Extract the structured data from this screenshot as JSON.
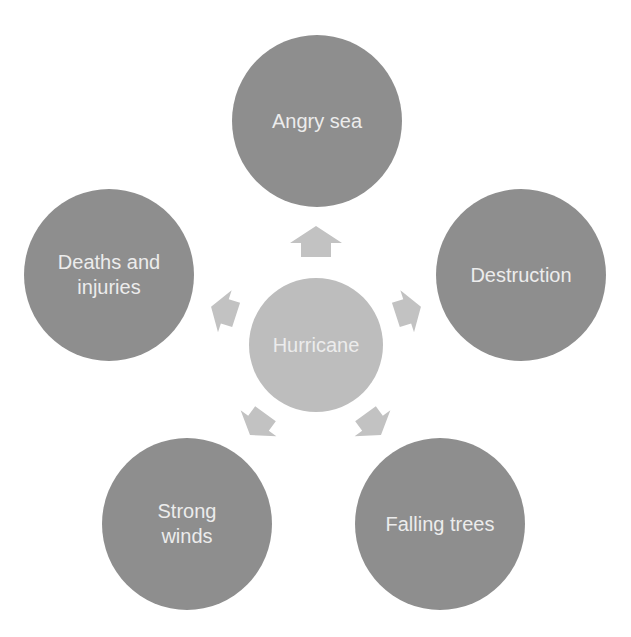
{
  "diagram": {
    "type": "radial-cycle",
    "colors": {
      "background": "#ffffff",
      "outer_node": "#8e8e8e",
      "center_node": "#bdbdbd",
      "arrow": "#c2c2c2",
      "label_text": "#ececec"
    },
    "center": {
      "label": "Hurricane"
    },
    "nodes": [
      {
        "id": "top",
        "label": "Angry sea"
      },
      {
        "id": "right",
        "label": "Destruction"
      },
      {
        "id": "bottom-right",
        "label": "Falling trees"
      },
      {
        "id": "bottom-left",
        "label": "Strong\nwinds",
        "lines": [
          "Strong",
          "winds"
        ]
      },
      {
        "id": "left",
        "label": "Deaths and\ninjuries",
        "lines": [
          "Deaths and",
          "injuries"
        ]
      }
    ],
    "arrows": [
      {
        "from": "Hurricane",
        "to": "Angry sea",
        "icon": "arrow-up-icon"
      },
      {
        "from": "Hurricane",
        "to": "Destruction",
        "icon": "arrow-right-icon"
      },
      {
        "from": "Hurricane",
        "to": "Falling trees",
        "icon": "arrow-down-right-icon"
      },
      {
        "from": "Hurricane",
        "to": "Strong winds",
        "icon": "arrow-down-left-icon"
      },
      {
        "from": "Hurricane",
        "to": "Deaths and injuries",
        "icon": "arrow-left-icon"
      }
    ]
  }
}
